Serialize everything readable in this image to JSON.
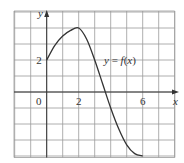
{
  "chart_data": {
    "type": "line",
    "title": "",
    "function_label": "y = f(x)",
    "xlabel": "x",
    "ylabel": "y",
    "xlim": [
      -2,
      8
    ],
    "ylim": [
      -4.3,
      5
    ],
    "grid": true,
    "grid_step": 1,
    "x_tick_labels": [
      {
        "value": 0,
        "label": "0"
      },
      {
        "value": 2,
        "label": "2"
      },
      {
        "value": 6,
        "label": "6"
      }
    ],
    "y_tick_labels": [
      {
        "value": 2,
        "label": "2"
      }
    ],
    "series": [
      {
        "name": "f(x)",
        "x": [
          0,
          0.5,
          1,
          1.5,
          2,
          2.5,
          3,
          3.5,
          4,
          4.5,
          5,
          5.5,
          6
        ],
        "values": [
          2,
          2.9,
          3.5,
          3.85,
          4,
          3.3,
          2,
          0.5,
          -1,
          -2.3,
          -3.3,
          -3.85,
          -4
        ]
      }
    ],
    "key_points": [
      {
        "x": 0,
        "y": 2,
        "note": "start"
      },
      {
        "x": 2,
        "y": 4,
        "note": "maximum"
      },
      {
        "x": 6,
        "y": -4,
        "note": "end"
      }
    ],
    "colors": {
      "grid": "#9a9a9a",
      "curve": "#333333",
      "axis": "#333333",
      "background": "#ffffff"
    }
  }
}
